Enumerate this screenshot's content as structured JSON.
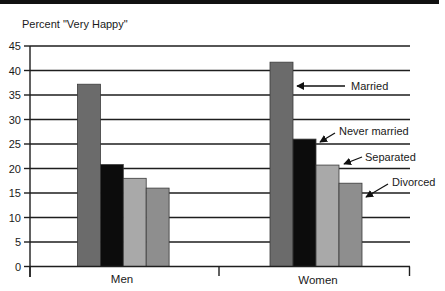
{
  "chart_data": {
    "type": "bar",
    "title": "",
    "ylabel": "Percent \"Very Happy\"",
    "xlabel": "",
    "ylim": [
      0,
      45
    ],
    "yticks": [
      0,
      5,
      10,
      15,
      20,
      25,
      30,
      35,
      40,
      45
    ],
    "grid": true,
    "legend": "annotations with arrows on Women group",
    "categories": [
      "Men",
      "Women"
    ],
    "series": [
      {
        "name": "Married",
        "values": [
          37.2,
          41.7
        ],
        "color": "#6b6b6b"
      },
      {
        "name": "Never married",
        "values": [
          20.8,
          26.0
        ],
        "color": "#0c0c0c"
      },
      {
        "name": "Separated",
        "values": [
          18.0,
          20.7
        ],
        "color": "#a9a9a9"
      },
      {
        "name": "Divorced",
        "values": [
          16.0,
          17.0
        ],
        "color": "#8e8e8e"
      }
    ],
    "annotations": [
      {
        "text": "Married",
        "target": "Women / Married"
      },
      {
        "text": "Never married",
        "target": "Women / Never married"
      },
      {
        "text": "Separated",
        "target": "Women / Separated"
      },
      {
        "text": "Divorced",
        "target": "Women / Divorced"
      }
    ]
  }
}
